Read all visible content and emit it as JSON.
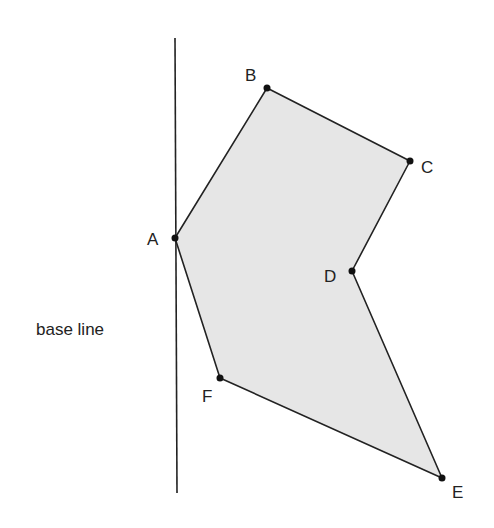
{
  "diagram": {
    "base_line_label": "base line",
    "colors": {
      "fill": "#e6e6e6",
      "stroke": "#222222",
      "point": "#111111"
    },
    "base_line": {
      "x1": 175,
      "y1": 38,
      "x2": 177,
      "y2": 493
    },
    "points": [
      {
        "name": "A",
        "x": 175,
        "y": 238,
        "label_x": 147,
        "label_y": 245
      },
      {
        "name": "B",
        "x": 267,
        "y": 88,
        "label_x": 245,
        "label_y": 81
      },
      {
        "name": "C",
        "x": 410,
        "y": 161,
        "label_x": 421,
        "label_y": 173
      },
      {
        "name": "D",
        "x": 352,
        "y": 271,
        "label_x": 324,
        "label_y": 282
      },
      {
        "name": "F",
        "x": 220,
        "y": 378,
        "label_x": 202,
        "label_y": 402
      },
      {
        "name": "E",
        "x": 442,
        "y": 478,
        "label_x": 452,
        "label_y": 498
      }
    ],
    "polygon_order": [
      "A",
      "B",
      "C",
      "D",
      "E",
      "F"
    ]
  }
}
